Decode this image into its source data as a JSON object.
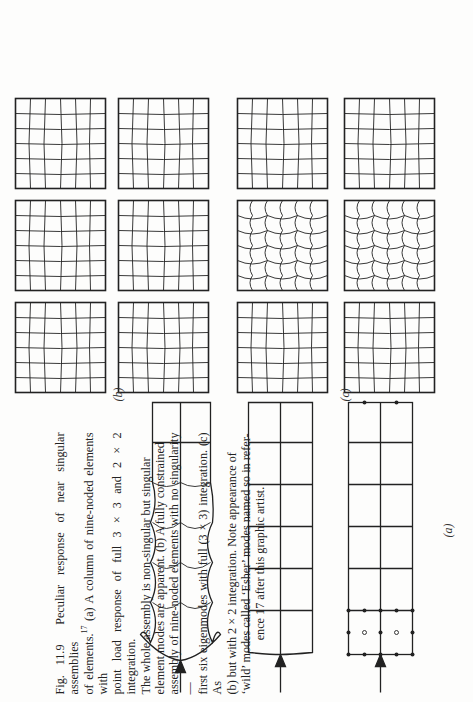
{
  "figure": {
    "number": "Fig. 11.9",
    "caption_lines": [
      "Peculiar response of near singular assemblies",
      "of elements.",
      "(a) A column of nine-noded elements with",
      "point load response of full 3 × 3 and 2 × 2 integration.",
      "The whole assembly is non-singular but singular",
      "element modes are apparent. (b) A fully constrained",
      "assembly of nine-noded elements with no singularity—",
      "first six eigenmodes with full (3 × 3) integration. (c) As",
      "(b) but with 2 × 2 integration. Note appearance of",
      "‘wild’ modes called ‘Esher’ modes named so in refer-",
      "ence 17 after this graphic artist."
    ],
    "reference_superscript": "17",
    "subfigure_labels": {
      "a": "(a)",
      "b": "(b)",
      "c": "(c)"
    }
  },
  "panels": {
    "a": {
      "strips": 3,
      "elements_per_strip": 5,
      "rows_per_strip": 2,
      "description": [
        "nine-noded element mesh with nodes",
        "deformed mesh 3x3 integration",
        "deformed mesh 2x2 integration (wild)"
      ]
    },
    "b": {
      "modes": 6,
      "mesh": "6x6"
    },
    "c": {
      "modes": 6,
      "mesh": "6x6",
      "esher_modes": 2
    }
  },
  "colors": {
    "ink": "#222222",
    "paper": "#fdfdfc"
  }
}
